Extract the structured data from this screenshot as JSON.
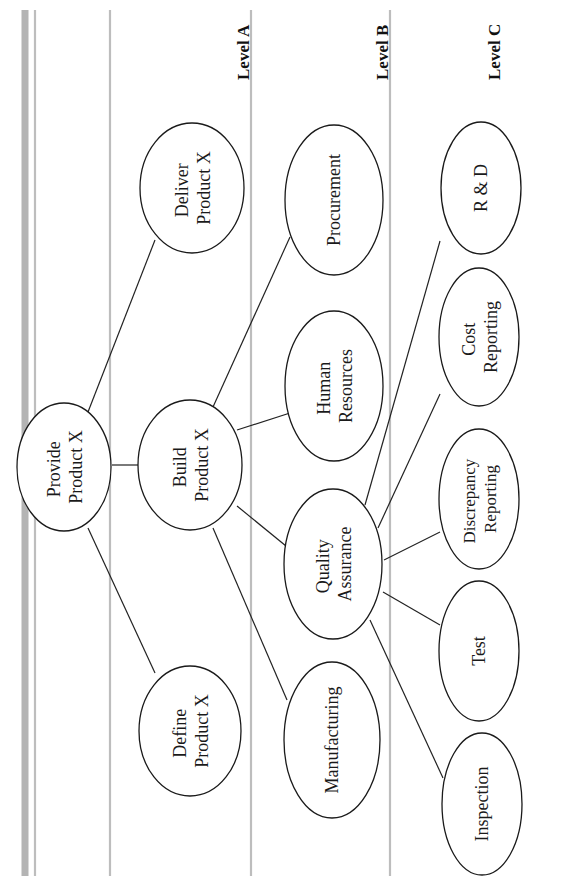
{
  "diagram": {
    "orientation": "rotated-90-ccw",
    "levels": [
      {
        "id": "A",
        "label": "Level A"
      },
      {
        "id": "B",
        "label": "Level B"
      },
      {
        "id": "C",
        "label": "Level C"
      }
    ],
    "nodes": {
      "root": {
        "lines": [
          "Provide",
          "Product X"
        ],
        "level": "root"
      },
      "define": {
        "lines": [
          "Define",
          "Product X"
        ],
        "level": "A"
      },
      "build": {
        "lines": [
          "Build",
          "Product X"
        ],
        "level": "A"
      },
      "deliver": {
        "lines": [
          "Deliver",
          "Product X"
        ],
        "level": "A"
      },
      "manufacturing": {
        "lines": [
          "Manufacturing"
        ],
        "level": "B"
      },
      "qa": {
        "lines": [
          "Quality",
          "Assurance"
        ],
        "level": "B"
      },
      "hr": {
        "lines": [
          "Human",
          "Resources"
        ],
        "level": "B"
      },
      "procurement": {
        "lines": [
          "Procurement"
        ],
        "level": "B"
      },
      "inspection": {
        "lines": [
          "Inspection"
        ],
        "level": "C"
      },
      "test": {
        "lines": [
          "Test"
        ],
        "level": "C"
      },
      "discrepancy": {
        "lines": [
          "Discrepancy",
          "Reporting"
        ],
        "level": "C"
      },
      "cost": {
        "lines": [
          "Cost",
          "Reporting"
        ],
        "level": "C"
      },
      "rnd": {
        "lines": [
          "R & D"
        ],
        "level": "C"
      }
    },
    "edges": [
      [
        "root",
        "define"
      ],
      [
        "root",
        "build"
      ],
      [
        "root",
        "deliver"
      ],
      [
        "build",
        "manufacturing"
      ],
      [
        "build",
        "qa"
      ],
      [
        "build",
        "hr"
      ],
      [
        "build",
        "procurement"
      ],
      [
        "qa",
        "inspection"
      ],
      [
        "qa",
        "test"
      ],
      [
        "qa",
        "discrepancy"
      ],
      [
        "qa",
        "cost"
      ],
      [
        "qa",
        "rnd"
      ]
    ],
    "colors": {
      "rule": "#bdbdbd",
      "rule_thick": "#b4b4b4",
      "stroke": "#1a1a1a",
      "background": "#ffffff"
    }
  }
}
